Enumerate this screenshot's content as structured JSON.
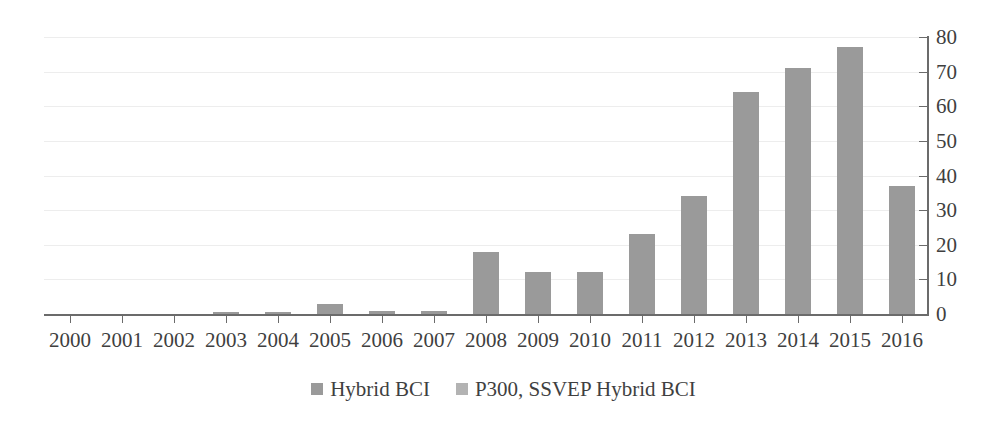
{
  "chart_data": {
    "type": "bar",
    "title": "",
    "subtitle": "",
    "xlabel": "",
    "ylabel": "",
    "ylim": [
      0,
      80
    ],
    "ytick_step": 10,
    "yticks": [
      "0",
      "10",
      "20",
      "30",
      "40",
      "50",
      "60",
      "70",
      "80"
    ],
    "grid": true,
    "y_axis_position": "right",
    "legend_position": "bottom-center",
    "categories": [
      "2000",
      "2001",
      "2002",
      "2003",
      "2004",
      "2005",
      "2006",
      "2007",
      "2008",
      "2009",
      "2010",
      "2011",
      "2012",
      "2013",
      "2014",
      "2015",
      "2016"
    ],
    "series": [
      {
        "name": "Hybrid BCI",
        "color": "#9a9a9a",
        "values": [
          0,
          0,
          0,
          0.5,
          0.5,
          3,
          1,
          1,
          18,
          12,
          12,
          23,
          34,
          64,
          71,
          77,
          37
        ]
      }
    ],
    "legend": [
      {
        "label": "Hybrid BCI",
        "color": "#9a9a9a"
      },
      {
        "label": "P300, SSVEP Hybrid BCI",
        "color": "#b3b3b3"
      }
    ]
  },
  "colors": {
    "bar": "#9a9a9a",
    "legend_swatch_2": "#b3b3b3",
    "axis": "#6b6b6b",
    "gridline": "#ededed",
    "text": "#3f3f3f",
    "background": "#ffffff"
  }
}
